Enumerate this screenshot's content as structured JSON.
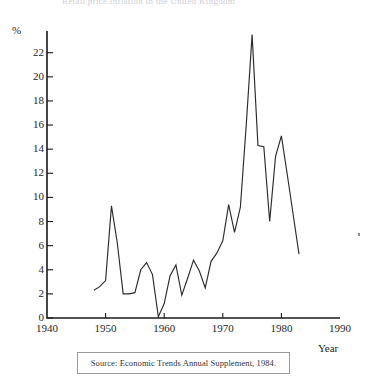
{
  "figure": {
    "clipped_header": "Retail price inflation in the United Kingdom",
    "speck_artifact": "scan-speck"
  },
  "axis": {
    "y_unit_label": "%",
    "x_axis_label": "Year",
    "y_ticks": [
      "0",
      "2",
      "4",
      "6",
      "8",
      "10",
      "12",
      "14",
      "16",
      "18",
      "20",
      "22"
    ],
    "x_ticks": [
      "1940",
      "1950",
      "1960",
      "1970",
      "1980",
      "1990"
    ]
  },
  "source": {
    "caption": "Source: Economic Trends Annual Supplement, 1984."
  },
  "colors": {
    "axis": "#1a1a1a",
    "line": "#2b2b2b",
    "background": "#ffffff",
    "caption_border": "#9a9a9a"
  },
  "chart_data": {
    "type": "line",
    "title": "Retail price inflation in the United Kingdom",
    "xlabel": "Year",
    "ylabel": "%",
    "xlim": [
      1940,
      1990
    ],
    "ylim": [
      0,
      23.8
    ],
    "ytick_step": 2,
    "xtick_step": 10,
    "grid": false,
    "legend": null,
    "series": [
      {
        "name": "Retail price inflation",
        "x": [
          1948,
          1949,
          1950,
          1951,
          1952,
          1953,
          1954,
          1955,
          1956,
          1957,
          1958,
          1959,
          1960,
          1961,
          1962,
          1963,
          1964,
          1965,
          1966,
          1967,
          1968,
          1969,
          1970,
          1971,
          1972,
          1973,
          1974,
          1975,
          1976,
          1977,
          1978,
          1979,
          1980,
          1981,
          1982,
          1983
        ],
        "values": [
          2.3,
          2.6,
          3.1,
          9.3,
          6.2,
          2.0,
          2.0,
          2.1,
          4.0,
          4.6,
          3.6,
          0.1,
          1.2,
          3.5,
          4.4,
          1.9,
          3.3,
          4.8,
          3.9,
          2.5,
          4.7,
          5.4,
          6.4,
          9.4,
          7.1,
          9.2,
          16.0,
          23.5,
          14.3,
          14.2,
          8.0,
          13.4,
          15.1,
          11.9,
          8.6,
          5.3
        ]
      }
    ]
  }
}
